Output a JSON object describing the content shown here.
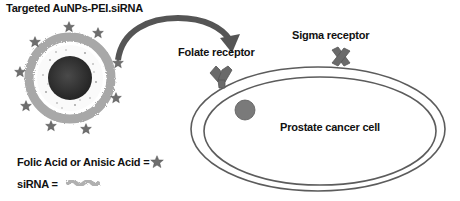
{
  "title": "Targeted AuNPs-PEI.siRNA",
  "labels": {
    "folate_receptor": "Folate receptor",
    "sigma_receptor": "Sigma receptor",
    "cell": "Prostate cancer cell"
  },
  "legend": {
    "ligand_label": "Folic Acid or Anisic Acid =",
    "ligand_icon": "star-icon",
    "sirna_label": "siRNA =",
    "sirna_icon": "sirna-squiggle-icon"
  },
  "colors": {
    "core": "#333333",
    "ring": "#a0a0a0",
    "star": "#6e6e6e",
    "arrow": "#5a5a5a",
    "receptor": "#6a6a6a",
    "membrane": "#5c5c5c",
    "nucleus": "#7a7a7a"
  }
}
